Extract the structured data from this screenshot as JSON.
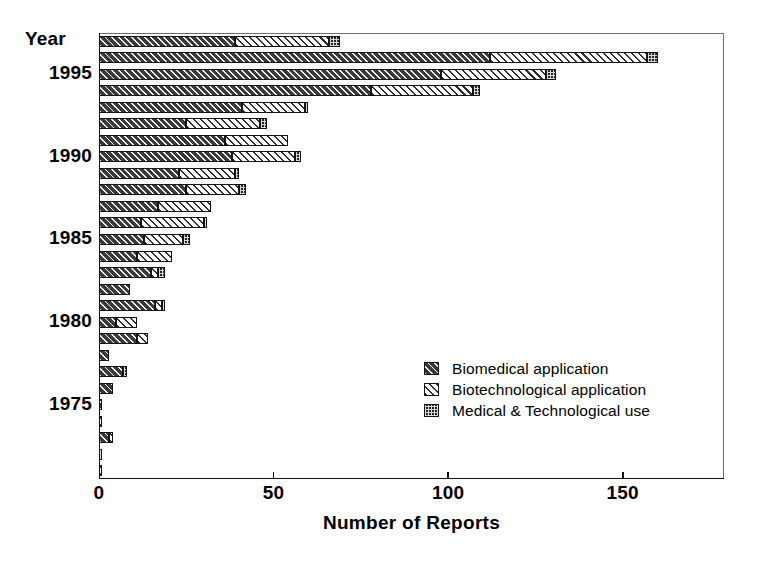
{
  "axes": {
    "y_title": "Year",
    "y_ticks": [
      {
        "label": "1995",
        "year": 1995
      },
      {
        "label": "1990",
        "year": 1990
      },
      {
        "label": "1985",
        "year": 1985
      },
      {
        "label": "1980",
        "year": 1980
      },
      {
        "label": "1975",
        "year": 1975
      }
    ],
    "x_title": "Number of Reports",
    "x_ticks": [
      "0",
      "50",
      "100",
      "150"
    ]
  },
  "legend": {
    "items": [
      {
        "label": "Biomedical application",
        "key": "biomedical",
        "swatch": "dark-diagonal-hatch"
      },
      {
        "label": "Biotechnological application",
        "key": "biotech",
        "swatch": "light-diagonal-hatch"
      },
      {
        "label": "Medical & Technological use",
        "key": "medtech",
        "swatch": "checker-hatch"
      }
    ]
  },
  "chart_data": {
    "type": "bar",
    "orientation": "horizontal",
    "stacked": true,
    "title": "",
    "xlabel": "Number of Reports",
    "ylabel": "Year",
    "xlim": [
      0,
      179
    ],
    "grid": false,
    "legend_position": "inside-lower-right",
    "categories": [
      1997,
      1996,
      1995,
      1994,
      1993,
      1992,
      1991,
      1990,
      1989,
      1988,
      1987,
      1986,
      1985,
      1984,
      1983,
      1982,
      1981,
      1980,
      1979,
      1978,
      1977,
      1976,
      1975,
      1974,
      1973,
      1972,
      1971
    ],
    "series": [
      {
        "name": "Biomedical application",
        "values": [
          39,
          112,
          98,
          78,
          41,
          25,
          36,
          38,
          23,
          25,
          17,
          12,
          13,
          11,
          15,
          9,
          16,
          5,
          11,
          3,
          7,
          4,
          1,
          0,
          3,
          0,
          0
        ]
      },
      {
        "name": "Biotechnological application",
        "values": [
          27,
          45,
          30,
          29,
          18,
          21,
          18,
          18,
          16,
          15,
          15,
          18,
          11,
          10,
          2,
          0,
          2,
          6,
          3,
          0,
          0,
          0,
          0,
          1,
          1,
          0,
          1
        ]
      },
      {
        "name": "Medical & Technological use",
        "values": [
          3,
          3,
          3,
          2,
          1,
          2,
          0,
          2,
          1,
          2,
          0,
          1,
          2,
          0,
          2,
          0,
          1,
          0,
          0,
          0,
          1,
          0,
          0,
          0,
          0,
          1,
          0
        ]
      }
    ],
    "totals": [
      69,
      160,
      131,
      109,
      60,
      48,
      54,
      58,
      40,
      42,
      32,
      31,
      26,
      21,
      19,
      9,
      19,
      11,
      14,
      3,
      8,
      4,
      1,
      1,
      4,
      1,
      1
    ]
  },
  "colors": {
    "biomedical": "#3a3a3a",
    "biotech": "#ffffff",
    "medtech": "#242424",
    "axis": "#111111",
    "background": "#ffffff"
  }
}
